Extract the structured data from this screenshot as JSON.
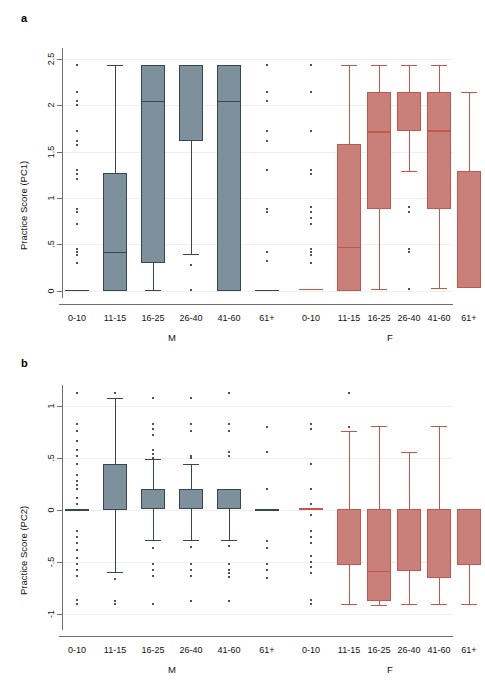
{
  "figure": {
    "panel_a_label": "a",
    "panel_b_label": "b"
  },
  "colors": {
    "male_fill": "#7d909c",
    "male_line": "#37474f",
    "female_fill": "#c9807b",
    "female_line": "#c4564e",
    "axis": "#6f6f6f",
    "grid": "#f0eeee",
    "outlier": "#1a1a1a"
  },
  "chart_data": [
    {
      "type": "box",
      "panel": "a",
      "title": "a",
      "ylabel": "Practice Score (PC1)",
      "xlabel": "",
      "ylim": [
        -0.08,
        2.62
      ],
      "yticks": [
        0,
        0.5,
        1,
        1.5,
        2,
        2.5
      ],
      "ytick_labels": [
        "0",
        ".5",
        "1",
        "1.5",
        "2",
        "2.5"
      ],
      "grid": true,
      "groups": [
        "M",
        "F"
      ],
      "categories": [
        "0-10",
        "11-15",
        "16-25",
        "26-40",
        "41-60",
        "61+"
      ],
      "boxes": [
        {
          "group": "M",
          "category": "0-10",
          "min": 0.0,
          "q1": 0.0,
          "median": 0.0,
          "q3": 0.0,
          "max": 0.0,
          "outliers": [
            2.44,
            2.15,
            2.05,
            2.0,
            1.72,
            1.62,
            1.57,
            1.3,
            1.26,
            1.2,
            0.88,
            0.85,
            0.72,
            0.45,
            0.42,
            0.38,
            0.3
          ]
        },
        {
          "group": "M",
          "category": "11-15",
          "min": 0.0,
          "q1": 0.0,
          "median": 0.42,
          "q3": 1.27,
          "max": 2.44,
          "outliers": []
        },
        {
          "group": "M",
          "category": "16-25",
          "min": 0.01,
          "q1": 0.3,
          "median": 2.05,
          "q3": 2.44,
          "max": 2.44,
          "outliers": []
        },
        {
          "group": "M",
          "category": "26-40",
          "min": 0.4,
          "q1": 1.62,
          "median": 2.44,
          "q3": 2.44,
          "max": 2.44,
          "outliers": [
            0.28,
            0.01
          ]
        },
        {
          "group": "M",
          "category": "41-60",
          "min": 0.0,
          "q1": 0.0,
          "median": 2.05,
          "q3": 2.44,
          "max": 2.44,
          "outliers": []
        },
        {
          "group": "M",
          "category": "61+",
          "min": 0.0,
          "q1": 0.0,
          "median": 0.0,
          "q3": 0.0,
          "max": 0.0,
          "outliers": [
            2.44,
            2.15,
            2.05,
            1.72,
            1.62,
            1.3,
            0.88,
            0.85,
            0.42,
            0.32
          ]
        },
        {
          "group": "F",
          "category": "0-10",
          "min": 0.01,
          "q1": 0.01,
          "median": 0.01,
          "q3": 0.01,
          "max": 0.01,
          "outliers": [
            2.44,
            2.15,
            1.72,
            1.3,
            1.26,
            0.9,
            0.85,
            0.78,
            0.72,
            0.45,
            0.42,
            0.38,
            0.3
          ]
        },
        {
          "group": "F",
          "category": "11-15",
          "min": 0.0,
          "q1": 0.0,
          "median": 0.47,
          "q3": 1.58,
          "max": 2.44,
          "outliers": []
        },
        {
          "group": "F",
          "category": "16-25",
          "min": 0.02,
          "q1": 0.88,
          "median": 1.72,
          "q3": 2.15,
          "max": 2.44,
          "outliers": []
        },
        {
          "group": "F",
          "category": "26-40",
          "min": 1.29,
          "q1": 1.72,
          "median": 1.72,
          "q3": 2.15,
          "max": 2.44,
          "outliers": [
            0.9,
            0.85,
            0.45,
            0.42,
            0.02
          ]
        },
        {
          "group": "F",
          "category": "41-60",
          "min": 0.03,
          "q1": 0.88,
          "median": 1.73,
          "q3": 2.15,
          "max": 2.44,
          "outliers": []
        },
        {
          "group": "F",
          "category": "61+",
          "min": 0.03,
          "q1": 0.03,
          "median": 1.29,
          "q3": 1.29,
          "max": 2.15,
          "outliers": []
        }
      ]
    },
    {
      "type": "box",
      "panel": "b",
      "title": "b",
      "ylabel": "Practice Score (PC2)",
      "xlabel": "",
      "ylim": [
        -1.15,
        1.2
      ],
      "yticks": [
        -1,
        -0.5,
        0,
        0.5,
        1
      ],
      "ytick_labels": [
        "-1",
        "-.5",
        "0",
        ".5",
        "1"
      ],
      "grid": true,
      "groups": [
        "M",
        "F"
      ],
      "categories": [
        "0-10",
        "11-15",
        "16-25",
        "26-40",
        "41-60",
        "61+"
      ],
      "boxes": [
        {
          "group": "M",
          "category": "0-10",
          "min": 0.0,
          "q1": 0.0,
          "median": 0.0,
          "q3": 0.0,
          "max": 0.0,
          "outliers": [
            1.12,
            0.83,
            0.76,
            0.66,
            0.58,
            0.52,
            0.44,
            0.34,
            0.28,
            0.24,
            0.2,
            0.12,
            0.06,
            -0.2,
            -0.26,
            -0.32,
            -0.38,
            -0.46,
            -0.52,
            -0.57,
            -0.63,
            -0.86,
            -0.9
          ]
        },
        {
          "group": "M",
          "category": "11-15",
          "min": -0.59,
          "q1": 0.0,
          "median": 0.0,
          "q3": 0.44,
          "max": 1.08,
          "outliers": [
            1.12,
            -0.66,
            -0.87,
            -0.9
          ]
        },
        {
          "group": "M",
          "category": "16-25",
          "min": -0.29,
          "q1": 0.01,
          "median": 0.01,
          "q3": 0.2,
          "max": 0.49,
          "outliers": [
            1.08,
            0.83,
            0.78,
            0.72,
            0.58,
            0.54,
            0.5,
            -0.36,
            -0.52,
            -0.57,
            -0.63,
            -0.9
          ]
        },
        {
          "group": "M",
          "category": "26-40",
          "min": -0.29,
          "q1": 0.01,
          "median": 0.01,
          "q3": 0.2,
          "max": 0.44,
          "outliers": [
            1.08,
            0.83,
            0.76,
            0.52,
            0.5,
            -0.35,
            -0.52,
            -0.57,
            -0.63,
            -0.87
          ]
        },
        {
          "group": "M",
          "category": "41-60",
          "min": -0.29,
          "q1": 0.01,
          "median": 0.01,
          "q3": 0.2,
          "max": 0.2,
          "outliers": [
            1.12,
            0.83,
            0.76,
            0.56,
            0.52,
            -0.34,
            -0.52,
            -0.57,
            -0.6,
            -0.64,
            -0.87
          ]
        },
        {
          "group": "M",
          "category": "61+",
          "min": 0.0,
          "q1": 0.0,
          "median": 0.0,
          "q3": 0.0,
          "max": 0.0,
          "outliers": [
            0.8,
            0.56,
            0.2,
            -0.3,
            -0.36,
            -0.52,
            -0.57,
            -0.65
          ]
        },
        {
          "group": "F",
          "category": "0-10",
          "min": 0.01,
          "q1": 0.01,
          "median": 0.01,
          "q3": 0.01,
          "max": 0.01,
          "outliers": [
            0.83,
            0.78,
            0.44,
            0.2,
            0.06,
            -0.05,
            -0.2,
            -0.26,
            -0.32,
            -0.44,
            -0.5,
            -0.55,
            -0.6,
            -0.86,
            -0.9
          ]
        },
        {
          "group": "F",
          "category": "11-15",
          "min": -0.9,
          "q1": -0.53,
          "median": 0.01,
          "q3": 0.01,
          "max": 0.76,
          "outliers": [
            1.12,
            0.8
          ]
        },
        {
          "group": "F",
          "category": "16-25",
          "min": -0.91,
          "q1": -0.87,
          "median": -0.58,
          "q3": 0.01,
          "max": 0.81,
          "outliers": []
        },
        {
          "group": "F",
          "category": "26-40",
          "min": -0.9,
          "q1": -0.58,
          "median": -0.58,
          "q3": 0.01,
          "max": 0.56,
          "outliers": []
        },
        {
          "group": "F",
          "category": "41-60",
          "min": -0.9,
          "q1": -0.65,
          "median": -0.65,
          "q3": 0.01,
          "max": 0.81,
          "outliers": []
        },
        {
          "group": "F",
          "category": "61+",
          "min": -0.9,
          "q1": -0.53,
          "median": -0.53,
          "q3": 0.01,
          "max": 0.01,
          "outliers": []
        }
      ]
    }
  ]
}
